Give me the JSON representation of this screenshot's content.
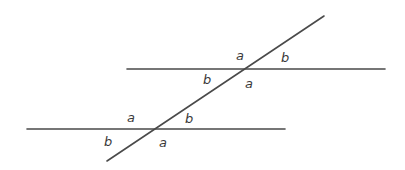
{
  "diagram": {
    "colors": {
      "line": "#4a4a4a",
      "label": "#3a3a3a",
      "background": "#ffffff"
    },
    "lines": {
      "upper_parallel": {
        "x1": 127,
        "y1": 69,
        "x2": 385,
        "y2": 69
      },
      "lower_parallel": {
        "x1": 27,
        "y1": 129,
        "x2": 285,
        "y2": 129
      },
      "transversal": {
        "x1": 107,
        "y1": 161,
        "x2": 324,
        "y2": 16
      }
    },
    "upper_intersection": {
      "labels": [
        {
          "text": "a",
          "position": "above-left",
          "x": 236,
          "y": 60
        },
        {
          "text": "b",
          "position": "above-right",
          "x": 281,
          "y": 62
        },
        {
          "text": "b",
          "position": "below-left",
          "x": 203,
          "y": 84
        },
        {
          "text": "a",
          "position": "below-right",
          "x": 245,
          "y": 88
        }
      ]
    },
    "lower_intersection": {
      "labels": [
        {
          "text": "a",
          "position": "above-left",
          "x": 127,
          "y": 122
        },
        {
          "text": "b",
          "position": "above-right",
          "x": 185,
          "y": 123
        },
        {
          "text": "b",
          "position": "below-left",
          "x": 104,
          "y": 146
        },
        {
          "text": "a",
          "position": "below-right",
          "x": 159,
          "y": 147
        }
      ]
    }
  }
}
